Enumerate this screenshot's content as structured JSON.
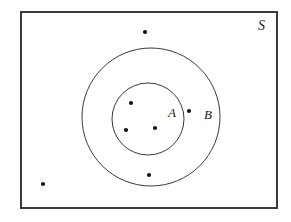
{
  "figure": {
    "type": "venn-diagram",
    "width": 291,
    "height": 222,
    "background_color": "#ffffff",
    "stroke_color": "#3a3a3a",
    "dot_color": "#111111"
  },
  "labels": {
    "sample_space": "S",
    "set_a": "A",
    "set_b": "B"
  },
  "chart_data": {
    "type": "diagram",
    "title": "",
    "regions": [
      {
        "name": "S",
        "label": "S",
        "shape": "rectangle",
        "x": 21,
        "y": 12,
        "width": 256,
        "height": 196,
        "label_x": 258,
        "label_y": 19,
        "stroke": "#3a3a3a",
        "stroke_width": 2,
        "fill": "none"
      },
      {
        "name": "B",
        "label": "B",
        "shape": "circle",
        "cx": 151,
        "cy": 117,
        "r": 69,
        "label_x": 204,
        "label_y": 108,
        "stroke": "#3a3a3a",
        "stroke_width": 1,
        "fill": "none"
      },
      {
        "name": "A",
        "label": "A",
        "shape": "circle",
        "cx": 148,
        "cy": 119,
        "r": 36,
        "label_x": 168,
        "label_y": 106,
        "stroke": "#3a3a3a",
        "stroke_width": 1,
        "fill": "none"
      }
    ],
    "points": [
      {
        "id": "p1",
        "x": 131,
        "y": 103,
        "r": 2.1,
        "region": "A"
      },
      {
        "id": "p2",
        "x": 126,
        "y": 130,
        "r": 2.1,
        "region": "A"
      },
      {
        "id": "p3",
        "x": 155,
        "y": 128,
        "r": 2.1,
        "region": "A"
      },
      {
        "id": "p4",
        "x": 189,
        "y": 111,
        "r": 2.1,
        "region": "B-not-A"
      },
      {
        "id": "p5",
        "x": 149,
        "y": 175,
        "r": 2.1,
        "region": "B-not-A"
      },
      {
        "id": "p6",
        "x": 145,
        "y": 32,
        "r": 2.1,
        "region": "S-not-B"
      },
      {
        "id": "p7",
        "x": 43,
        "y": 184,
        "r": 2.1,
        "region": "S-not-B"
      }
    ],
    "point_counts": {
      "in_A": 3,
      "in_B_only": 2,
      "in_S_only": 2,
      "total": 7
    }
  }
}
